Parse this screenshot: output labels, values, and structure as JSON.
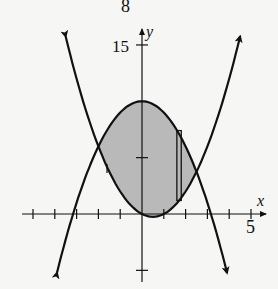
{
  "figure": {
    "number_label": "8",
    "x_axis_label": "x",
    "y_axis_label": "y",
    "x_tick_label": "5",
    "y_tick_label": "15"
  },
  "colors": {
    "background": "#f6f6f4",
    "ink": "#111111",
    "shade": "#b9b9b9"
  },
  "chart_data": {
    "type": "area",
    "title": "8",
    "xlabel": "x",
    "ylabel": "y",
    "xlim": [
      -5.5,
      5.6
    ],
    "ylim": [
      -6,
      16
    ],
    "x_ticks": [
      -5,
      -4,
      -3,
      -2,
      -1,
      1,
      2,
      3,
      4,
      5
    ],
    "x_tick_labels_shown": {
      "5": "5"
    },
    "y_ticks": [
      -5,
      5,
      15
    ],
    "y_tick_labels_shown": {
      "15": "15"
    },
    "grid": false,
    "series": [
      {
        "name": "y = 10 - x^2",
        "kind": "curve",
        "x_range": [
          -3.9,
          3.9
        ],
        "points": [
          [
            -3.9,
            -5.21
          ],
          [
            -3,
            1
          ],
          [
            -2,
            6
          ],
          [
            -1,
            9
          ],
          [
            0,
            10
          ],
          [
            1,
            9
          ],
          [
            2,
            6
          ],
          [
            2.5,
            3.75
          ],
          [
            3,
            1
          ],
          [
            3.9,
            -5.21
          ]
        ]
      },
      {
        "name": "y = x^2 - x",
        "kind": "curve",
        "x_range": [
          -3.5,
          4.5
        ],
        "points": [
          [
            -3.5,
            15.75
          ],
          [
            -3,
            12
          ],
          [
            -2,
            6
          ],
          [
            -1,
            2
          ],
          [
            0,
            0
          ],
          [
            0.5,
            -0.25
          ],
          [
            1,
            0
          ],
          [
            2,
            2
          ],
          [
            2.5,
            3.75
          ],
          [
            3,
            6
          ],
          [
            4,
            12
          ],
          [
            4.5,
            15.75
          ]
        ]
      }
    ],
    "shaded_region": {
      "between": [
        "y = 10 - x^2",
        "y = x^2 - x"
      ],
      "x_from": -2,
      "x_to": 2.5
    },
    "intersections": [
      [
        -2,
        6
      ],
      [
        2.5,
        3.75
      ]
    ],
    "representative_rectangle": {
      "x_from": 1.6,
      "x_to": 1.8,
      "y_bottom": 1.2,
      "y_top": 7.4
    }
  }
}
